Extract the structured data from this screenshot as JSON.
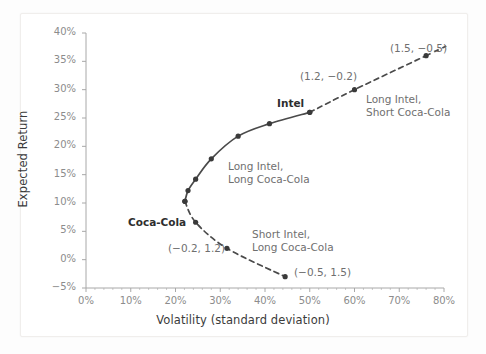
{
  "chart_data": {
    "type": "line",
    "title": "",
    "xlabel": "Volatility (standard deviation)",
    "ylabel": "Expected Return",
    "xlim": [
      0,
      80
    ],
    "ylim": [
      -5,
      40
    ],
    "xunit": "%",
    "yunit": "%",
    "xticks": [
      "0%",
      "10%",
      "20%",
      "30%",
      "40%",
      "50%",
      "60%",
      "70%",
      "80%"
    ],
    "yticks": [
      "40%",
      "35%",
      "30%",
      "25%",
      "20%",
      "15%",
      "10%",
      "5%",
      "0%",
      "-5%"
    ],
    "grid": false,
    "legend": "none",
    "series": [
      {
        "name": "Efficient frontier (long-long, solid)",
        "style": "solid",
        "color": "#4a4a4a",
        "points": [
          {
            "x": 22.1,
            "y": 10.3,
            "label": "minimum-variance"
          },
          {
            "x": 22.8,
            "y": 12.2,
            "label": ""
          },
          {
            "x": 24.5,
            "y": 14.2,
            "label": ""
          },
          {
            "x": 28.0,
            "y": 17.8,
            "label": ""
          },
          {
            "x": 34.0,
            "y": 21.8,
            "label": ""
          },
          {
            "x": 41.0,
            "y": 24.0,
            "label": ""
          },
          {
            "x": 50.0,
            "y": 26.0,
            "label": "Intel"
          }
        ]
      },
      {
        "name": "Leveraged extension (long Intel, short Coca-Cola, dashed)",
        "style": "dashed",
        "color": "#4a4a4a",
        "points": [
          {
            "x": 50.0,
            "y": 26.0,
            "label": "Intel"
          },
          {
            "x": 60.0,
            "y": 30.0,
            "label": "(1.2, -0.2)"
          },
          {
            "x": 76.0,
            "y": 36.0,
            "label": "(1.5, -0.5)"
          }
        ]
      },
      {
        "name": "Inefficient branch (short Intel, long Coca-Cola, dashed)",
        "style": "dashed",
        "color": "#4a4a4a",
        "points": [
          {
            "x": 22.1,
            "y": 10.3,
            "label": ""
          },
          {
            "x": 24.5,
            "y": 6.6,
            "label": "Coca-Cola"
          },
          {
            "x": 31.5,
            "y": 2.0,
            "label": "(-0.2, 1.2)"
          },
          {
            "x": 44.5,
            "y": -3.0,
            "label": "(-0.5, 1.5)"
          }
        ]
      }
    ],
    "annotations": [
      {
        "name": "intel-label",
        "text": "Intel",
        "bold": true,
        "x": 277,
        "y": 97
      },
      {
        "name": "coca-cola-label",
        "text": "Coca-Cola",
        "bold": true,
        "x": 128,
        "y": 216
      },
      {
        "name": "point-label-1-2",
        "text": "(1.2, −0.2)",
        "bold": false,
        "x": 300,
        "y": 70
      },
      {
        "name": "point-label-1-5",
        "text": "(1.5, −0.5)",
        "bold": false,
        "x": 390,
        "y": 42
      },
      {
        "name": "point-label-neg-0-2",
        "text": "(−0.2, 1.2)",
        "bold": false,
        "x": 168,
        "y": 242
      },
      {
        "name": "point-label-neg-0-5",
        "text": "(−0.5, 1.5)",
        "bold": false,
        "x": 294,
        "y": 266
      },
      {
        "name": "long-short-annotation",
        "text": "Long Intel,\nShort Coca-Cola",
        "bold": false,
        "x": 366,
        "y": 93
      },
      {
        "name": "long-long-annotation",
        "text": "Long Intel,\nLong Coca-Cola",
        "bold": false,
        "x": 228,
        "y": 160
      },
      {
        "name": "short-long-annotation",
        "text": "Short Intel,\nLong Coca-Cola",
        "bold": false,
        "x": 252,
        "y": 228
      }
    ],
    "colors": {
      "line": "#4a4a4a",
      "marker": "#3a3a3a",
      "axis": "#a8a8a8",
      "tick_text": "#8c8c8c",
      "axis_title": "#3b3b3b",
      "annotation": "#6f6f6f",
      "background": "#ffffff"
    }
  }
}
